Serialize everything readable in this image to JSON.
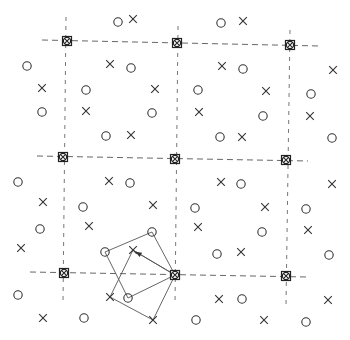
{
  "diagram": {
    "title": "",
    "colors": {
      "ink": "#333333",
      "grid": "#555555",
      "background": "#ffffff"
    },
    "grid": {
      "nodes": [
        {
          "x": 67,
          "y": 41
        },
        {
          "x": 177,
          "y": 43
        },
        {
          "x": 290,
          "y": 45
        },
        {
          "x": 63,
          "y": 157
        },
        {
          "x": 175,
          "y": 159
        },
        {
          "x": 286,
          "y": 160
        },
        {
          "x": 64,
          "y": 273
        },
        {
          "x": 175,
          "y": 275
        },
        {
          "x": 286,
          "y": 276
        }
      ],
      "horizontal_lines": [
        {
          "x1": 42,
          "y1": 40,
          "x2": 320,
          "y2": 46
        },
        {
          "x1": 37,
          "y1": 156,
          "x2": 308,
          "y2": 161
        },
        {
          "x1": 30,
          "y1": 272,
          "x2": 308,
          "y2": 277
        }
      ],
      "vertical_lines": [
        {
          "x1": 66,
          "y1": 17,
          "x2": 63,
          "y2": 303
        },
        {
          "x1": 178,
          "y1": 26,
          "x2": 175,
          "y2": 305
        },
        {
          "x1": 290,
          "y1": 30,
          "x2": 286,
          "y2": 306
        }
      ]
    },
    "circles": [
      {
        "x": 118,
        "y": 22
      },
      {
        "x": 221,
        "y": 23
      },
      {
        "x": 27,
        "y": 66
      },
      {
        "x": 131,
        "y": 68
      },
      {
        "x": 243,
        "y": 69
      },
      {
        "x": 86,
        "y": 90
      },
      {
        "x": 198,
        "y": 90
      },
      {
        "x": 311,
        "y": 94
      },
      {
        "x": 42,
        "y": 112
      },
      {
        "x": 152,
        "y": 113
      },
      {
        "x": 263,
        "y": 116
      },
      {
        "x": 106,
        "y": 136
      },
      {
        "x": 220,
        "y": 137
      },
      {
        "x": 332,
        "y": 138
      },
      {
        "x": 18,
        "y": 182
      },
      {
        "x": 130,
        "y": 183
      },
      {
        "x": 241,
        "y": 184
      },
      {
        "x": 83,
        "y": 207
      },
      {
        "x": 195,
        "y": 208
      },
      {
        "x": 306,
        "y": 209
      },
      {
        "x": 40,
        "y": 229
      },
      {
        "x": 262,
        "y": 232
      },
      {
        "x": 152,
        "y": 232
      },
      {
        "x": 105,
        "y": 252
      },
      {
        "x": 217,
        "y": 254
      },
      {
        "x": 329,
        "y": 255
      },
      {
        "x": 18,
        "y": 295
      },
      {
        "x": 128,
        "y": 298
      },
      {
        "x": 242,
        "y": 299
      },
      {
        "x": 84,
        "y": 318
      },
      {
        "x": 196,
        "y": 320
      },
      {
        "x": 306,
        "y": 322
      }
    ],
    "crosses": [
      {
        "x": 133,
        "y": 19
      },
      {
        "x": 243,
        "y": 21
      },
      {
        "x": 110,
        "y": 64
      },
      {
        "x": 222,
        "y": 66
      },
      {
        "x": 333,
        "y": 70
      },
      {
        "x": 42,
        "y": 88
      },
      {
        "x": 155,
        "y": 89
      },
      {
        "x": 266,
        "y": 91
      },
      {
        "x": 86,
        "y": 111
      },
      {
        "x": 199,
        "y": 112
      },
      {
        "x": 310,
        "y": 116
      },
      {
        "x": 131,
        "y": 135
      },
      {
        "x": 242,
        "y": 137
      },
      {
        "x": 109,
        "y": 181
      },
      {
        "x": 221,
        "y": 182
      },
      {
        "x": 332,
        "y": 184
      },
      {
        "x": 43,
        "y": 202
      },
      {
        "x": 153,
        "y": 205
      },
      {
        "x": 265,
        "y": 207
      },
      {
        "x": 89,
        "y": 226
      },
      {
        "x": 198,
        "y": 227
      },
      {
        "x": 308,
        "y": 230
      },
      {
        "x": 21,
        "y": 248
      },
      {
        "x": 133,
        "y": 250
      },
      {
        "x": 241,
        "y": 252
      },
      {
        "x": 110,
        "y": 297
      },
      {
        "x": 219,
        "y": 299
      },
      {
        "x": 328,
        "y": 300
      },
      {
        "x": 43,
        "y": 318
      },
      {
        "x": 153,
        "y": 320
      },
      {
        "x": 264,
        "y": 320
      }
    ],
    "circle_polygon": {
      "label": "circle neighbor quadrilateral",
      "points": [
        {
          "x": 105,
          "y": 252
        },
        {
          "x": 152,
          "y": 232
        },
        {
          "x": 175,
          "y": 275
        },
        {
          "x": 128,
          "y": 298
        }
      ]
    },
    "cross_polygon": {
      "label": "cross neighbor quadrilateral",
      "points": [
        {
          "x": 133,
          "y": 250
        },
        {
          "x": 175,
          "y": 275
        },
        {
          "x": 153,
          "y": 320
        },
        {
          "x": 110,
          "y": 297
        }
      ],
      "arrow": {
        "from": {
          "x": 175,
          "y": 275
        },
        "to": {
          "x": 133,
          "y": 250
        }
      }
    }
  }
}
